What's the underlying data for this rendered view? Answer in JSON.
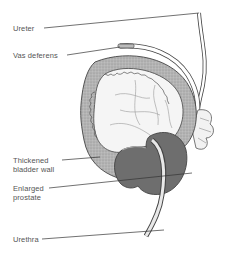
{
  "diagram": {
    "labels": [
      {
        "id": "ureter",
        "line1": "Ureter",
        "line2": ""
      },
      {
        "id": "vas-deferens",
        "line1": "Vas deferens",
        "line2": ""
      },
      {
        "id": "thickened-bladder-wall",
        "line1": "Thickened",
        "line2": "bladder wall"
      },
      {
        "id": "enlarged-prostate",
        "line1": "Enlarged",
        "line2": "prostate"
      },
      {
        "id": "urethra",
        "line1": "Urethra",
        "line2": ""
      }
    ],
    "colors": {
      "bladder_wall": "#b8b8b8",
      "bladder_interior": "#f4f4f4",
      "prostate": "#6e6e6e",
      "outline": "#444444",
      "leader_line": "#333333",
      "label_text": "#555555"
    }
  }
}
